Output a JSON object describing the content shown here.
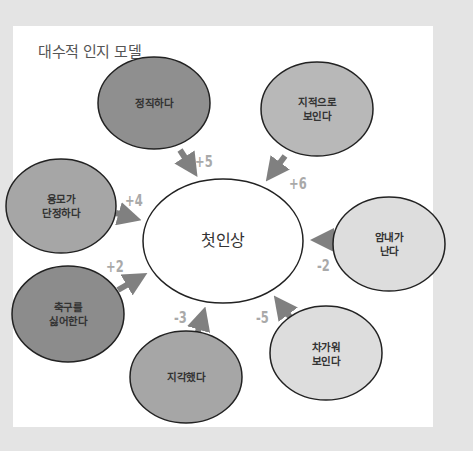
{
  "title": "대수적 인지 모델",
  "center": {
    "label": "첫인상"
  },
  "colors": {
    "background": "#e4e4e4",
    "card": "#ffffff",
    "positive_dark": "#8c8c8c",
    "positive_mid": "#a8a8a8",
    "negative_mid": "#b8b8b8",
    "negative_light": "#dcdcdc",
    "arrow": "#808080",
    "weight_text": "#a9a9a9"
  },
  "nodes": [
    {
      "id": "honest",
      "label": "정직하다",
      "weight": "+5"
    },
    {
      "id": "smart",
      "label": "지적으로\n보인다",
      "weight": "+6"
    },
    {
      "id": "neat",
      "label": "용모가\n단정하다",
      "weight": "+4"
    },
    {
      "id": "smell",
      "label": "암내가\n난다",
      "weight": "-2"
    },
    {
      "id": "soccer",
      "label": "축구를\n싫어한다",
      "weight": "+2"
    },
    {
      "id": "late",
      "label": "지각했다",
      "weight": "-3"
    },
    {
      "id": "cold",
      "label": "차가워\n보인다",
      "weight": "-5"
    }
  ]
}
